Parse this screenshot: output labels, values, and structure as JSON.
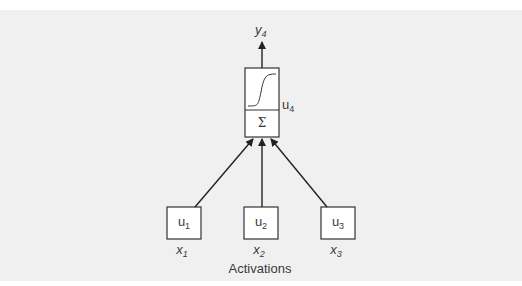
{
  "diagram": {
    "type": "neural-network-unit",
    "output": {
      "label": "y",
      "subscript": "4"
    },
    "neuron": {
      "id": "u4",
      "label": "u",
      "subscript": "4",
      "activation_icon": "sigmoid-curve",
      "summation_symbol": "Σ"
    },
    "inputs": [
      {
        "unit_label": "u",
        "unit_subscript": "1",
        "activation_label": "x",
        "activation_subscript": "1"
      },
      {
        "unit_label": "u",
        "unit_subscript": "2",
        "activation_label": "x",
        "activation_subscript": "2"
      },
      {
        "unit_label": "u",
        "unit_subscript": "3",
        "activation_label": "x",
        "activation_subscript": "3"
      }
    ],
    "caption": "Activations",
    "colors": {
      "background": "#f0f0f0",
      "box_fill": "#ffffff",
      "stroke": "#333333",
      "text": "#3a3a3a"
    }
  }
}
